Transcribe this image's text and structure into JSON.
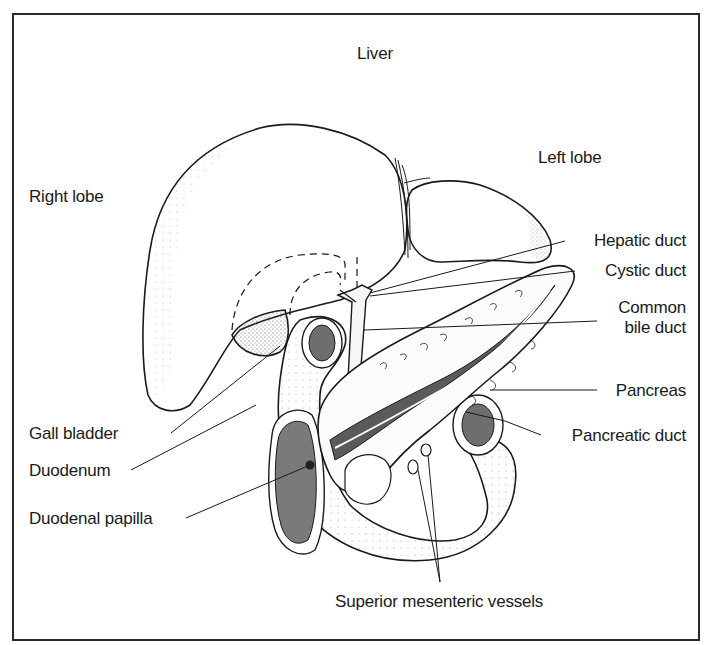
{
  "diagram": {
    "title": "Liver",
    "labels": {
      "liver": "Liver",
      "left_lobe": "Left lobe",
      "right_lobe": "Right lobe",
      "hepatic_duct": "Hepatic duct",
      "cystic_duct": "Cystic duct",
      "common_bile_duct_1": "Common",
      "common_bile_duct_2": "bile duct",
      "pancreas": "Pancreas",
      "pancreatic_duct": "Pancreatic duct",
      "gall_bladder": "Gall bladder",
      "duodenum": "Duodenum",
      "duodenal_papilla": "Duodenal papilla",
      "superior_mesenteric_vessels": "Superior mesenteric vessels"
    },
    "colors": {
      "ink": "#1a1a1a",
      "shade": "#6e6e6e",
      "paper": "#ffffff"
    }
  }
}
